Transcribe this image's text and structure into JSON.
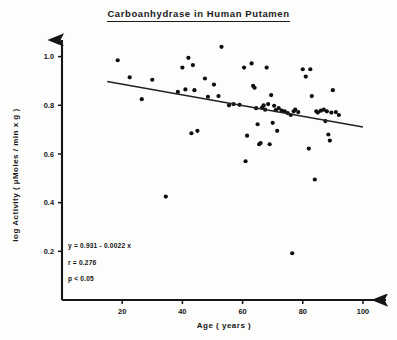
{
  "chart_data": {
    "type": "scatter",
    "title": "Carboanhydrase  in  Human  Putamen",
    "xlabel": "Age  ( years )",
    "ylabel": "log  Activity  ( µMoles / min  x  g )",
    "xlim": [
      0,
      105
    ],
    "ylim": [
      0,
      1.06
    ],
    "xticks": [
      20,
      40,
      60,
      80,
      100
    ],
    "yticks": [
      "0.2",
      "0.4",
      "0.6",
      "0.8",
      "1.0"
    ],
    "ytick_values": [
      0.2,
      0.4,
      0.6,
      0.8,
      1.0
    ],
    "grid": false,
    "legend": null,
    "x": [
      18.5,
      22.5,
      26.5,
      30.0,
      34.5,
      38.5,
      40.0,
      41.0,
      42.0,
      43.0,
      43.5,
      44.0,
      45.0,
      47.5,
      48.5,
      50.5,
      52.0,
      53.0,
      55.5,
      57.0,
      59.0,
      60.5,
      61.0,
      61.5,
      63.0,
      63.5,
      64.0,
      64.5,
      65.0,
      65.5,
      66.0,
      66.5,
      67.0,
      67.5,
      68.0,
      68.5,
      69.0,
      69.5,
      70.0,
      70.5,
      71.0,
      71.5,
      72.0,
      73.0,
      74.0,
      75.0,
      76.0,
      76.5,
      77.0,
      77.5,
      78.5,
      80.0,
      81.0,
      82.0,
      82.5,
      83.0,
      84.0,
      84.5,
      85.0,
      86.0,
      87.0,
      87.5,
      88.0,
      88.5,
      89.0,
      89.5,
      90.0,
      91.0,
      92.0
    ],
    "y": [
      0.985,
      0.915,
      0.825,
      0.905,
      0.425,
      0.855,
      0.955,
      0.865,
      0.995,
      0.685,
      0.965,
      0.862,
      0.695,
      0.91,
      0.835,
      0.885,
      0.838,
      1.04,
      0.8,
      0.805,
      0.802,
      0.955,
      0.57,
      0.675,
      0.972,
      0.88,
      0.872,
      0.788,
      0.722,
      0.64,
      0.645,
      0.79,
      0.8,
      0.782,
      0.955,
      0.805,
      0.64,
      0.842,
      0.728,
      0.798,
      0.78,
      0.695,
      0.788,
      0.778,
      0.775,
      0.768,
      0.76,
      0.192,
      0.775,
      0.782,
      0.772,
      0.948,
      0.918,
      0.622,
      0.948,
      0.838,
      0.495,
      0.775,
      0.77,
      0.778,
      0.782,
      0.735,
      0.775,
      0.68,
      0.655,
      0.77,
      0.862,
      0.772,
      0.76
    ],
    "regression": {
      "slope": -0.0022,
      "intercept": 0.931,
      "x_start": 15.0,
      "x_end": 100.0
    },
    "annotations": [
      "y =  0.931 - 0.0022 x",
      "r =  0.276",
      "p <  0.05"
    ]
  }
}
